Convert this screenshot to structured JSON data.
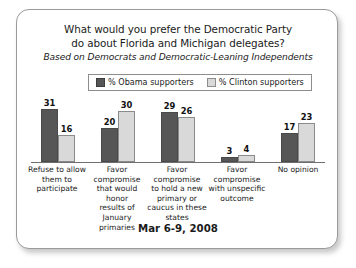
{
  "card": {
    "title_lines": [
      "What would you prefer the Democratic Party",
      "do about Florida and Michigan delegates?"
    ],
    "subtitle": "Based on Democrats and Democratic-Leaning Independents",
    "footer": "Mar 6-9, 2008"
  },
  "legend": {
    "items": [
      {
        "label": "% Obama supporters",
        "color": "#565656"
      },
      {
        "label": "% Clinton supporters",
        "color": "#d9d9d9"
      }
    ]
  },
  "chart_data": {
    "type": "bar",
    "title": "What would you prefer the Democratic Party do about Florida and Michigan delegates?",
    "subtitle": "Based on Democrats and Democratic-Leaning Independents",
    "xlabel": "",
    "ylabel": "",
    "ylim": [
      0,
      35
    ],
    "grid": false,
    "legend_position": "top-center",
    "annotation": "Mar 6-9, 2008",
    "categories": [
      "Refuse to allow them to participate",
      "Favor compromise that would honor results of January primaries",
      "Favor compromise to hold a new primary or caucus in these states",
      "Favor compromise with unspecific outcome",
      "No opinion"
    ],
    "category_lines": [
      [
        "Refuse to allow",
        "them to",
        "participate"
      ],
      [
        "Favor",
        "compromise",
        "that would honor",
        "results of January",
        "primaries"
      ],
      [
        "Favor",
        "compromise",
        "to hold a new",
        "primary or",
        "caucus in these",
        "states"
      ],
      [
        "Favor",
        "compromise",
        "with unspecific",
        "outcome"
      ],
      [
        "No opinion"
      ]
    ],
    "series": [
      {
        "name": "% Obama supporters",
        "color": "#565656",
        "values": [
          31,
          20,
          29,
          3,
          17
        ]
      },
      {
        "name": "% Clinton supporters",
        "color": "#d9d9d9",
        "values": [
          16,
          30,
          26,
          4,
          23
        ]
      }
    ]
  }
}
